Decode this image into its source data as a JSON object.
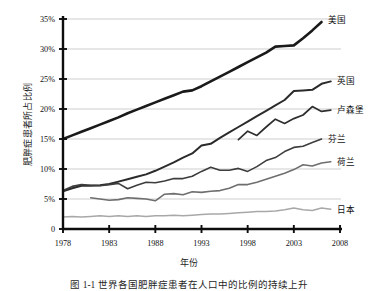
{
  "chart_data": {
    "type": "line",
    "title": "",
    "xlabel": "年份",
    "ylabel": "肥胖症患者所占比例",
    "xlim": [
      1978,
      2008
    ],
    "ylim": [
      0,
      35
    ],
    "grid": true,
    "legend_position": "inline-right",
    "xticks": [
      "1978",
      "1983",
      "1988",
      "1993",
      "1998",
      "2003",
      "2008"
    ],
    "xtick_values": [
      1978,
      1983,
      1988,
      1993,
      1998,
      2003,
      2008
    ],
    "yticks": [
      "0",
      "5%",
      "10%",
      "15%",
      "20%",
      "25%",
      "30%",
      "35%"
    ],
    "ytick_values": [
      0,
      5,
      10,
      15,
      20,
      25,
      30,
      35
    ],
    "series": [
      {
        "name": "美国",
        "color": "#1a1a1a",
        "width": 2.6,
        "x": [
          1978,
          1979,
          1980,
          1981,
          1982,
          1983,
          1984,
          1985,
          1986,
          1987,
          1988,
          1989,
          1990,
          1991,
          1992,
          1993,
          1994,
          1995,
          1996,
          1997,
          1998,
          1999,
          2000,
          2001,
          2002,
          2003,
          2004,
          2005,
          2006
        ],
        "values": [
          15.0,
          15.6,
          16.2,
          16.8,
          17.4,
          18.0,
          18.6,
          19.3,
          19.9,
          20.5,
          21.1,
          21.7,
          22.3,
          22.9,
          23.1,
          23.8,
          24.6,
          25.4,
          26.2,
          27.0,
          27.8,
          28.6,
          29.4,
          30.4,
          30.5,
          30.6,
          31.8,
          33.1,
          34.5
        ]
      },
      {
        "name": "英国",
        "color": "#2b2b2b",
        "width": 2.0,
        "x": [
          1978,
          1979,
          1980,
          1981,
          1982,
          1983,
          1984,
          1985,
          1986,
          1987,
          1988,
          1989,
          1990,
          1991,
          1992,
          1993,
          1994,
          1995,
          1996,
          1997,
          1998,
          1999,
          2000,
          2001,
          2002,
          2003,
          2004,
          2005,
          2006,
          2007
        ],
        "values": [
          6.3,
          6.8,
          7.2,
          7.2,
          7.3,
          7.5,
          7.9,
          8.3,
          8.7,
          9.1,
          9.7,
          10.4,
          11.1,
          11.9,
          12.6,
          13.9,
          14.2,
          15.2,
          16.1,
          17.0,
          17.9,
          18.8,
          19.7,
          20.6,
          21.5,
          23.0,
          23.1,
          23.2,
          24.2,
          24.6
        ]
      },
      {
        "name": "卢森堡",
        "color": "#2e2e2e",
        "width": 1.7,
        "x": [
          1997,
          1998,
          1999,
          2000,
          2001,
          2002,
          2003,
          2004,
          2005,
          2006,
          2007
        ],
        "values": [
          14.9,
          16.3,
          15.6,
          17.0,
          18.3,
          17.6,
          18.4,
          19.0,
          20.4,
          19.6,
          19.8
        ]
      },
      {
        "name": "芬兰",
        "color": "#3d3d3d",
        "width": 1.6,
        "x": [
          1978,
          1979,
          1980,
          1981,
          1982,
          1983,
          1984,
          1985,
          1986,
          1987,
          1988,
          1989,
          1990,
          1991,
          1992,
          1993,
          1994,
          1995,
          1996,
          1997,
          1998,
          1999,
          2000,
          2001,
          2002,
          2003,
          2004,
          2005,
          2006
        ],
        "values": [
          6.4,
          7.1,
          7.4,
          7.3,
          7.2,
          7.4,
          7.6,
          6.7,
          7.3,
          7.8,
          7.7,
          8.0,
          8.4,
          8.4,
          8.8,
          9.6,
          10.3,
          9.8,
          9.8,
          10.1,
          9.6,
          10.4,
          11.4,
          11.9,
          12.9,
          13.6,
          13.8,
          14.4,
          15.0
        ]
      },
      {
        "name": "荷兰",
        "color": "#6e6e6e",
        "width": 1.6,
        "x": [
          1981,
          1982,
          1983,
          1984,
          1985,
          1986,
          1987,
          1988,
          1989,
          1990,
          1991,
          1992,
          1993,
          1994,
          1995,
          1996,
          1997,
          1998,
          1999,
          2000,
          2001,
          2002,
          2003,
          2004,
          2005,
          2006,
          2007
        ],
        "values": [
          5.2,
          5.0,
          4.8,
          4.9,
          5.2,
          5.1,
          5.0,
          4.7,
          5.8,
          5.9,
          5.7,
          6.2,
          6.1,
          6.3,
          6.4,
          6.8,
          7.4,
          7.4,
          7.8,
          8.3,
          8.8,
          9.3,
          9.9,
          10.7,
          10.5,
          11.0,
          11.2
        ]
      },
      {
        "name": "日本",
        "color": "#a8a8a8",
        "width": 1.5,
        "x": [
          1978,
          1979,
          1980,
          1981,
          1982,
          1983,
          1984,
          1985,
          1986,
          1987,
          1988,
          1989,
          1990,
          1991,
          1992,
          1993,
          1994,
          1995,
          1996,
          1997,
          1998,
          1999,
          2000,
          2001,
          2002,
          2003,
          2004,
          2005,
          2006,
          2007
        ],
        "values": [
          2.0,
          2.1,
          2.0,
          2.1,
          2.2,
          2.1,
          2.2,
          2.1,
          2.2,
          2.1,
          2.2,
          2.2,
          2.3,
          2.2,
          2.3,
          2.4,
          2.5,
          2.5,
          2.6,
          2.7,
          2.8,
          2.9,
          2.9,
          3.0,
          3.2,
          3.5,
          3.2,
          3.1,
          3.5,
          3.3
        ]
      }
    ]
  },
  "axis": {
    "ylabel": "肥胖症患者所占比例",
    "xlabel": "年份"
  },
  "caption": {
    "text": "图 1-1  世界各国肥胖症患者在人口中的比例的持续上升"
  }
}
